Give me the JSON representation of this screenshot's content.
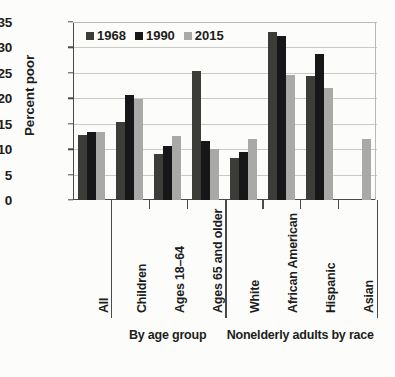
{
  "chart_data": {
    "type": "bar",
    "title": "",
    "xlabel": "",
    "ylabel": "Percent poor",
    "ylim": [
      0,
      35
    ],
    "yticks": [
      0,
      5,
      10,
      15,
      20,
      25,
      30,
      35
    ],
    "grid": true,
    "legend_position": "top-left",
    "categories": [
      "All",
      "Children",
      "Ages 18–64",
      "Ages 65 and older",
      "White",
      "African American",
      "Hispanic",
      "Asian"
    ],
    "series": [
      {
        "name": "1968",
        "color": "#3c3c39",
        "values": [
          12.7,
          15.4,
          9.1,
          25.3,
          8.3,
          33.0,
          24.4,
          null
        ]
      },
      {
        "name": "1990",
        "color": "#17171a",
        "values": [
          13.3,
          20.6,
          10.6,
          11.7,
          9.5,
          32.3,
          28.8,
          null
        ]
      },
      {
        "name": "2015",
        "color": "#a9a9a7",
        "values": [
          13.3,
          19.8,
          12.5,
          10.0,
          12.0,
          24.6,
          22.0,
          12.0
        ]
      }
    ],
    "group_captions": [
      {
        "label": "By age group",
        "categories": [
          "Children",
          "Ages 18–64",
          "Ages 65 and older"
        ]
      },
      {
        "label": "Nonelderly adults by race",
        "categories": [
          "White",
          "African American",
          "Hispanic",
          "Asian"
        ]
      }
    ],
    "annotations": []
  },
  "footnote": "",
  "colors": {
    "series_1968": "#3c3c39",
    "series_1990": "#17171a",
    "series_2015": "#a9a9a7",
    "axis": "#4a4a48",
    "grid": "#c9c9c6",
    "background": "#fcfcfb"
  }
}
